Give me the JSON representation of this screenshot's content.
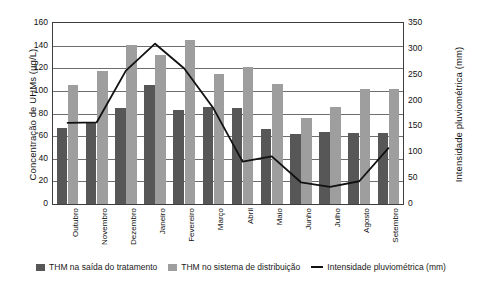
{
  "chart_data": {
    "type": "bar",
    "title": "",
    "xlabel": "",
    "ylabel": "Concentração de UHMs (µg/L)",
    "y2label": "Intensidade pluviométrica (mm)",
    "ylim": [
      0,
      160
    ],
    "y2lim": [
      0,
      350
    ],
    "yticks": [
      160,
      140,
      120,
      100,
      80,
      60,
      40,
      20,
      0
    ],
    "y2ticks": [
      350,
      300,
      250,
      200,
      150,
      100,
      50,
      0
    ],
    "grid": true,
    "legend_position": "bottom",
    "categories": [
      "Outubro",
      "Novembro",
      "Dezembro",
      "Janeiro",
      "Fevereiro",
      "Março",
      "Abril",
      "Maio",
      "Junho",
      "Julho",
      "Agosto",
      "Setembro"
    ],
    "series": [
      {
        "name": "THM na saída do tratamento",
        "kind": "bar",
        "axis": "left",
        "color": "#575757",
        "values": [
          67,
          72,
          85,
          105,
          83,
          86,
          85,
          66,
          62,
          64,
          63,
          63
        ]
      },
      {
        "name": "THM no sistema de distribuição",
        "kind": "bar",
        "axis": "left",
        "color": "#9e9e9e",
        "values": [
          105,
          118,
          141,
          132,
          145,
          115,
          121,
          106,
          76,
          86,
          102,
          102
        ]
      },
      {
        "name": "Intensidade pluviométrica (mm)",
        "kind": "line",
        "axis": "right",
        "color": "#111111",
        "values": [
          157,
          158,
          258,
          310,
          262,
          185,
          82,
          92,
          42,
          33,
          44,
          108
        ]
      }
    ]
  },
  "legend": [
    {
      "label": "THM na saída do tratamento",
      "marker": "dark-square-swatch"
    },
    {
      "label": "THM no sistema de distribuição",
      "marker": "light-square-swatch"
    },
    {
      "label": "Intensidade pluviométrica (mm)",
      "marker": "line-swatch"
    }
  ]
}
